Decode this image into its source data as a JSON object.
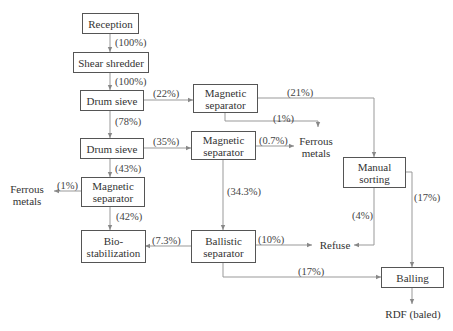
{
  "diagram": {
    "type": "flowchart",
    "nodes": {
      "reception": "Reception",
      "shear_shredder": "Shear shredder",
      "drum_sieve_1": "Drum sieve",
      "drum_sieve_2": "Drum sieve",
      "magnetic_separator_1": "Magnetic\nseparator",
      "magnetic_separator_2": "Magnetic\nseparator",
      "magnetic_separator_3": "Magnetic\nseparator",
      "manual_sorting": "Manual\nsorting",
      "bio_stabilization": "Bio-\nstabilization",
      "ballistic_separator": "Ballistic\nseparator",
      "balling": "Balling"
    },
    "outputs": {
      "ferrous_metals_right": "Ferrous\nmetals",
      "ferrous_metals_left": "Ferrous\nmetals",
      "refuse": "Refuse",
      "rdf_baled": "RDF (baled)"
    },
    "edges": [
      {
        "from": "Reception",
        "to": "Shear shredder",
        "label": "(100%)"
      },
      {
        "from": "Shear shredder",
        "to": "Drum sieve",
        "label": "(100%)"
      },
      {
        "from": "Drum sieve",
        "to": "Magnetic separator",
        "label": "(22%)"
      },
      {
        "from": "Magnetic separator",
        "to": "Manual sorting",
        "label": "(21%)"
      },
      {
        "from": "Magnetic separator",
        "to": "Ferrous metals",
        "label": "(1%)"
      },
      {
        "from": "Drum sieve",
        "to": "Drum sieve",
        "label": "(78%)"
      },
      {
        "from": "Drum sieve",
        "to": "Magnetic separator",
        "label": "(35%)"
      },
      {
        "from": "Magnetic separator",
        "to": "Ferrous metals",
        "label": "(0.7%)"
      },
      {
        "from": "Magnetic separator",
        "to": "Ballistic separator",
        "label": "(34.3%)"
      },
      {
        "from": "Drum sieve",
        "to": "Magnetic separator",
        "label": "(43%)"
      },
      {
        "from": "Magnetic separator",
        "to": "Ferrous metals",
        "label": "(1%)"
      },
      {
        "from": "Magnetic separator",
        "to": "Bio-stabilization",
        "label": "(42%)"
      },
      {
        "from": "Ballistic separator",
        "to": "Bio-stabilization",
        "label": "(7.3%)"
      },
      {
        "from": "Ballistic separator",
        "to": "Refuse",
        "label": "(10%)"
      },
      {
        "from": "Manual sorting",
        "to": "Refuse",
        "label": "(4%)"
      },
      {
        "from": "Manual sorting",
        "to": "Balling",
        "label": "(17%)"
      },
      {
        "from": "Ballistic separator",
        "to": "Balling",
        "label": "(17%)"
      },
      {
        "from": "Balling",
        "to": "RDF (baled)",
        "label": ""
      }
    ],
    "labels": {
      "e_rec_shr": "(100%)",
      "e_shr_ds1": "(100%)",
      "e_ds1_ms1": "(22%)",
      "e_ms1_man": "(21%)",
      "e_ms1_fe": "(1%)",
      "e_ds1_ds2": "(78%)",
      "e_ds2_ms2": "(35%)",
      "e_ms2_fe": "(0.7%)",
      "e_ms2_bal": "(34.3%)",
      "e_ds2_ms3": "(43%)",
      "e_ms3_fe": "(1%)",
      "e_ms3_bio": "(42%)",
      "e_bal_bio": "(7.3%)",
      "e_bal_ref": "(10%)",
      "e_man_ref": "(4%)",
      "e_man_ball": "(17%)",
      "e_bal_ball": "(17%)"
    },
    "colors": {
      "line": "#888888",
      "box_border": "#555555",
      "text": "#333333"
    }
  }
}
